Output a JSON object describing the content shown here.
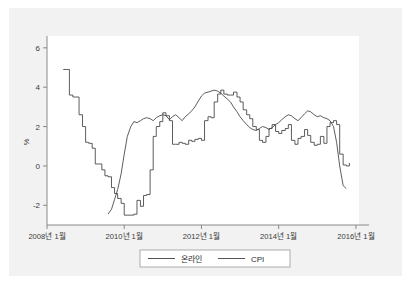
{
  "figure": {
    "panel_bg": "#f2f2f2",
    "plot_bg": "#ffffff",
    "axis_color": "#7d7d7d",
    "line_color": "#404040"
  },
  "chart_data": {
    "type": "line",
    "title": "",
    "xlabel": "",
    "ylabel": "%",
    "ylim": [
      -3,
      6.6
    ],
    "xlim": [
      2008.0,
      2016.08
    ],
    "grid": false,
    "legend_position": "bottom",
    "yticks": [
      -2,
      0,
      2,
      4,
      6
    ],
    "ytick_labels": [
      "-2",
      "0",
      "2",
      "4",
      "6"
    ],
    "xticks": [
      2008.0,
      2010.0,
      2012.0,
      2014.0,
      2016.0
    ],
    "xtick_labels": [
      "2008년 1월",
      "2010년 1월",
      "2012년 1월",
      "2014년 1월",
      "2016년 1월"
    ],
    "series": [
      {
        "name": "온라인",
        "style": "smooth",
        "x": [
          2009.58,
          2009.67,
          2009.75,
          2009.83,
          2009.92,
          2010.0,
          2010.08,
          2010.17,
          2010.25,
          2010.33,
          2010.42,
          2010.5,
          2010.58,
          2010.67,
          2010.75,
          2010.83,
          2010.92,
          2011.0,
          2011.08,
          2011.17,
          2011.25,
          2011.33,
          2011.42,
          2011.5,
          2011.58,
          2011.67,
          2011.75,
          2011.83,
          2011.92,
          2012.0,
          2012.08,
          2012.17,
          2012.25,
          2012.33,
          2012.42,
          2012.5,
          2012.58,
          2012.67,
          2012.75,
          2012.83,
          2012.92,
          2013.0,
          2013.08,
          2013.17,
          2013.25,
          2013.33,
          2013.42,
          2013.5,
          2013.58,
          2013.67,
          2013.75,
          2013.83,
          2013.92,
          2014.0,
          2014.08,
          2014.17,
          2014.25,
          2014.33,
          2014.42,
          2014.5,
          2014.58,
          2014.67,
          2014.75,
          2014.83,
          2014.92,
          2015.0,
          2015.08,
          2015.17,
          2015.25,
          2015.33,
          2015.42,
          2015.5,
          2015.58,
          2015.67,
          2015.75
        ],
        "values": [
          -2.45,
          -2.2,
          -1.7,
          -1.2,
          -0.4,
          0.6,
          1.5,
          2.0,
          2.25,
          2.2,
          2.3,
          2.4,
          2.45,
          2.4,
          2.3,
          2.45,
          2.55,
          2.6,
          2.55,
          2.35,
          2.5,
          2.6,
          2.45,
          2.3,
          2.5,
          2.65,
          2.8,
          3.0,
          3.3,
          3.55,
          3.7,
          3.75,
          3.8,
          3.85,
          3.8,
          3.7,
          3.55,
          3.4,
          3.25,
          3.0,
          2.75,
          2.5,
          2.3,
          2.1,
          1.95,
          1.85,
          1.8,
          1.9,
          2.0,
          1.95,
          1.85,
          1.95,
          2.1,
          2.2,
          2.35,
          2.5,
          2.6,
          2.55,
          2.4,
          2.3,
          2.45,
          2.65,
          2.8,
          2.75,
          2.6,
          2.5,
          2.55,
          2.45,
          2.4,
          2.3,
          2.0,
          1.2,
          0.0,
          -1.0,
          -1.15
        ]
      },
      {
        "name": "CPI",
        "style": "step",
        "x": [
          2008.42,
          2008.5,
          2008.58,
          2008.67,
          2008.75,
          2008.83,
          2008.92,
          2009.0,
          2009.08,
          2009.17,
          2009.25,
          2009.33,
          2009.42,
          2009.5,
          2009.58,
          2009.67,
          2009.75,
          2009.83,
          2009.92,
          2010.0,
          2010.08,
          2010.17,
          2010.25,
          2010.33,
          2010.42,
          2010.5,
          2010.58,
          2010.67,
          2010.75,
          2010.83,
          2010.92,
          2011.0,
          2011.08,
          2011.17,
          2011.25,
          2011.33,
          2011.42,
          2011.5,
          2011.58,
          2011.67,
          2011.75,
          2011.83,
          2011.92,
          2012.0,
          2012.08,
          2012.17,
          2012.25,
          2012.33,
          2012.42,
          2012.5,
          2012.58,
          2012.67,
          2012.75,
          2012.83,
          2012.92,
          2013.0,
          2013.08,
          2013.17,
          2013.25,
          2013.33,
          2013.42,
          2013.5,
          2013.58,
          2013.67,
          2013.75,
          2013.83,
          2013.92,
          2014.0,
          2014.08,
          2014.17,
          2014.25,
          2014.33,
          2014.42,
          2014.5,
          2014.58,
          2014.67,
          2014.75,
          2014.83,
          2014.92,
          2015.0,
          2015.08,
          2015.17,
          2015.25,
          2015.33,
          2015.42,
          2015.5,
          2015.58,
          2015.67,
          2015.75,
          2015.83
        ],
        "values": [
          4.9,
          4.9,
          3.6,
          3.5,
          3.5,
          2.6,
          2.0,
          1.2,
          1.15,
          0.9,
          0.1,
          0.1,
          -0.2,
          -0.5,
          -0.55,
          -1.1,
          -1.4,
          -1.65,
          -1.9,
          -2.5,
          -2.5,
          -2.5,
          -2.45,
          -1.75,
          -2.05,
          -1.5,
          -1.45,
          -0.2,
          1.5,
          2.0,
          2.25,
          2.7,
          2.55,
          2.3,
          1.1,
          1.1,
          1.2,
          1.15,
          1.1,
          1.3,
          1.25,
          1.35,
          1.4,
          1.3,
          2.3,
          2.5,
          2.45,
          3.25,
          3.65,
          3.85,
          3.65,
          3.6,
          3.6,
          3.75,
          3.5,
          3.25,
          2.85,
          2.6,
          2.4,
          2.0,
          1.85,
          1.3,
          1.2,
          1.5,
          1.9,
          2.1,
          1.75,
          1.65,
          1.8,
          1.9,
          2.1,
          1.3,
          1.1,
          1.4,
          1.5,
          1.85,
          1.55,
          1.2,
          1.05,
          1.1,
          1.5,
          1.15,
          2.0,
          2.2,
          2.3,
          2.1,
          0.6,
          0.05,
          0.0,
          0.15
        ]
      }
    ]
  },
  "legend": {
    "entries": [
      {
        "label": "온라인"
      },
      {
        "label": "CPI"
      }
    ]
  }
}
